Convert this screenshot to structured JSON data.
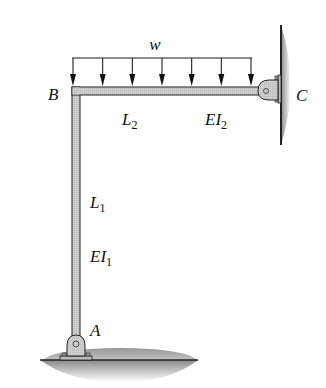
{
  "diagram": {
    "labels": {
      "load": "w",
      "joint_b": "B",
      "joint_c": "C",
      "joint_a": "A",
      "span2_length": "L",
      "span2_length_sub": "2",
      "span2_stiffness": "EI",
      "span2_stiffness_sub": "2",
      "span1_length": "L",
      "span1_length_sub": "1",
      "span1_stiffness": "EI",
      "span1_stiffness_sub": "1"
    },
    "members": [
      {
        "name": "column AB",
        "from": "A",
        "to": "B",
        "length": "L1",
        "stiffness": "EI1"
      },
      {
        "name": "beam BC",
        "from": "B",
        "to": "C",
        "length": "L2",
        "stiffness": "EI2"
      }
    ],
    "supports": [
      {
        "joint": "A",
        "type": "pin",
        "on": "ground"
      },
      {
        "joint": "C",
        "type": "pin",
        "on": "wall"
      }
    ],
    "load": {
      "type": "uniform distributed",
      "symbol": "w",
      "on": "beam BC",
      "arrows": 7
    },
    "colors": {
      "member_fill": "#c8c8c8",
      "outline": "#222222",
      "background": "#ffffff"
    }
  }
}
